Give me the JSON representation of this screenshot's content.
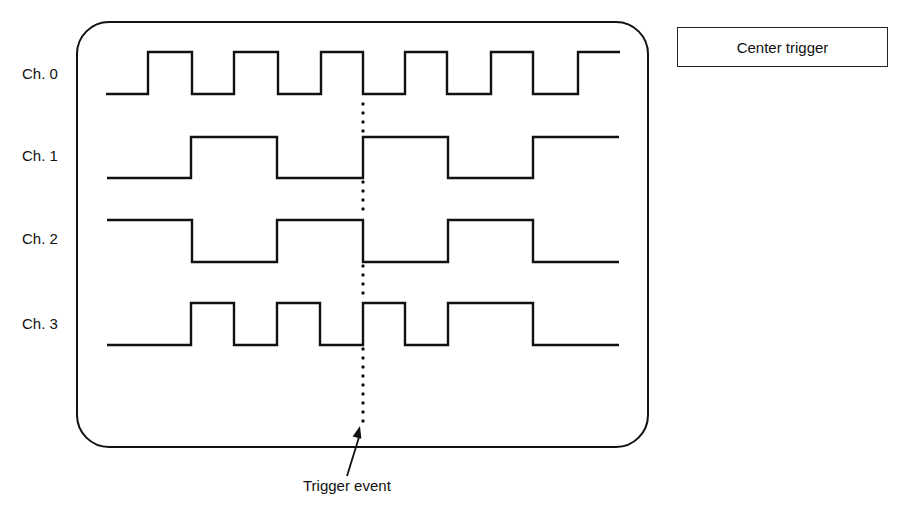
{
  "diagram": {
    "type": "logic-analyzer-timing-diagram",
    "mode_label": "Center trigger",
    "annotation": "Trigger event",
    "screen": {
      "x": 77,
      "y": 22,
      "width": 571,
      "height": 425,
      "corner_radius": 32
    },
    "trigger_x": 363,
    "channels": [
      {
        "label": "Ch. 0",
        "label_y": 73,
        "high_y": 52,
        "low_y": 94,
        "start_x": 106,
        "end_x": 620,
        "start_level": "low",
        "transitions": [
          148,
          192,
          234,
          278,
          321,
          363,
          405,
          447,
          491,
          533,
          578
        ]
      },
      {
        "label": "Ch. 1",
        "label_y": 155,
        "high_y": 137,
        "low_y": 178,
        "start_x": 107,
        "end_x": 619,
        "start_level": "low",
        "transitions": [
          191,
          277,
          363,
          448,
          533
        ]
      },
      {
        "label": "Ch. 2",
        "label_y": 238,
        "high_y": 220,
        "low_y": 262,
        "start_x": 107,
        "end_x": 619,
        "start_level": "high",
        "transitions": [
          192,
          277,
          363,
          448,
          533
        ]
      },
      {
        "label": "Ch. 3",
        "label_y": 323,
        "high_y": 303,
        "low_y": 345,
        "start_x": 107,
        "end_x": 619,
        "start_level": "low",
        "transitions": [
          191,
          234,
          277,
          320,
          363,
          405,
          448,
          533
        ]
      }
    ],
    "trigger_line": {
      "x": 363,
      "segments": [
        [
          104,
          133
        ],
        [
          182,
          216
        ],
        [
          266,
          299
        ],
        [
          349,
          422
        ]
      ],
      "dot_spacing": 9
    },
    "arrow": {
      "from": [
        347,
        476
      ],
      "to": [
        360,
        426
      ]
    },
    "colors": {
      "ink": "#111111",
      "background": "#ffffff"
    }
  }
}
